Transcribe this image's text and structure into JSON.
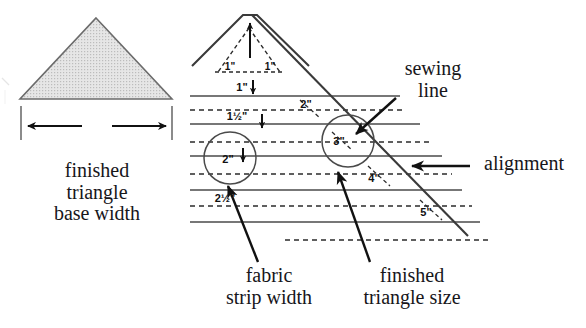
{
  "figure": {
    "colors": {
      "line": "#3a3a3a",
      "triangle_fill": "#d7d7d7",
      "triangle_stroke": "#6b6b6b",
      "arrow": "#111111",
      "text": "#17161a",
      "dashed": "#2b2b2b"
    }
  },
  "left_panel": {
    "shape_name": "finished triangle",
    "caption_lines": [
      "finished",
      "triangle",
      "base width"
    ],
    "caption": "finished\ntriangle\nbase width",
    "arrow_left": "left-arrow",
    "arrow_right": "right-arrow",
    "end_tick_left": "|",
    "end_tick_right": "|"
  },
  "right_panel": {
    "apex_arrow": "up-arrow",
    "strip_widths": [
      {
        "label": "1\"",
        "arrow": "down-arrow"
      },
      {
        "label": "1½\"",
        "arrow": "down-arrow"
      },
      {
        "label": "2\"",
        "arrow": "down-arrow",
        "circled": true
      },
      {
        "label": "2½\"",
        "arrow": "none"
      }
    ],
    "triangle_sizes": [
      {
        "label": "1\"",
        "position": "apex-left"
      },
      {
        "label": "1\"",
        "position": "apex-right"
      },
      {
        "label": "2\"",
        "position": "row-2"
      },
      {
        "label": "3\"",
        "position": "row-3",
        "circled": true
      },
      {
        "label": "4\"",
        "position": "row-4"
      },
      {
        "label": "5\"",
        "position": "row-5"
      }
    ],
    "captions": {
      "fabric_strip_width": "fabric\nstrip width",
      "fabric_strip_width_lines": [
        "fabric",
        "strip width"
      ],
      "finished_triangle_size": "finished\ntriangle size",
      "finished_triangle_size_lines": [
        "finished",
        "triangle size"
      ],
      "sewing_line": "sewing\nline",
      "sewing_line_lines": [
        "sewing",
        "line"
      ],
      "alignment": "alignment"
    }
  }
}
